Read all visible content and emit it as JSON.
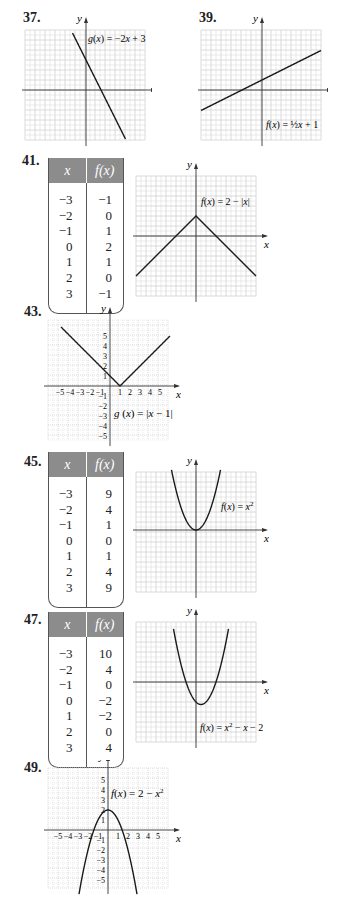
{
  "page": {
    "problems": [
      {
        "number": "37.",
        "type": "graph",
        "equation": "g(x) = −2x + 3",
        "x_label": "x",
        "y_label": "y"
      },
      {
        "number": "39.",
        "type": "graph",
        "equation": "f(x) = ½x + 1",
        "x_label": "x",
        "y_label": "y"
      },
      {
        "number": "41.",
        "type": "table+graph",
        "equation": "f(x) = 2 − |x|",
        "x_label": "x",
        "y_label": "y",
        "table": {
          "headers": [
            "x",
            "f(x)"
          ],
          "x": [
            "−3",
            "−2",
            "−1",
            "0",
            "1",
            "2",
            "3"
          ],
          "fx": [
            "−1",
            "0",
            "1",
            "2",
            "1",
            "0",
            "−1"
          ]
        }
      },
      {
        "number": "43.",
        "type": "graph",
        "equation": "g (x) = |x − 1|",
        "x_label": "x",
        "y_label": "y",
        "x_ticks": [
          "−5",
          "−4",
          "−3",
          "−2",
          "−1",
          "1",
          "2",
          "3",
          "4",
          "5"
        ],
        "y_ticks": [
          "5",
          "4",
          "3",
          "2",
          "1",
          "−1",
          "−2",
          "−3",
          "−4",
          "−5"
        ]
      },
      {
        "number": "45.",
        "type": "table+graph",
        "equation": "f(x) = x²",
        "x_label": "x",
        "y_label": "y",
        "table": {
          "headers": [
            "x",
            "f(x)"
          ],
          "x": [
            "−3",
            "−2",
            "−1",
            "0",
            "1",
            "2",
            "3"
          ],
          "fx": [
            "9",
            "4",
            "1",
            "0",
            "1",
            "4",
            "9"
          ]
        }
      },
      {
        "number": "47.",
        "type": "table+graph",
        "equation": "f(x) = x² − x − 2",
        "x_label": "x",
        "y_label": "y",
        "table": {
          "headers": [
            "x",
            "f(x)"
          ],
          "x": [
            "−3",
            "−2",
            "−1",
            "0",
            "1",
            "2",
            "3"
          ],
          "fx": [
            "10",
            "4",
            "0",
            "−2",
            "−2",
            "0",
            "4"
          ]
        }
      },
      {
        "number": "49.",
        "type": "graph",
        "equation": "f(x) = 2 − x²",
        "x_label": "x",
        "y_label": "y",
        "x_ticks": [
          "−5",
          "−4",
          "−3",
          "−2",
          "−1",
          "1",
          "2",
          "3",
          "4",
          "5"
        ],
        "y_ticks": [
          "5",
          "4",
          "3",
          "2",
          "1",
          "−1",
          "−2",
          "−3",
          "−4",
          "−5"
        ]
      }
    ],
    "colors": {
      "table_header": "#8c8c8c",
      "grid": "#d6d6d6",
      "axis": "#333333",
      "curve": "#1a1a1a"
    }
  }
}
